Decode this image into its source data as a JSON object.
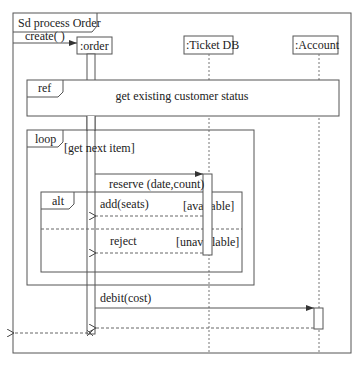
{
  "frame": {
    "kind": "Sd",
    "title": "Sd process Order"
  },
  "lifelines": [
    {
      "label": ":order"
    },
    {
      "label": ":Ticket DB"
    },
    {
      "label": ":Account"
    }
  ],
  "messages": {
    "create": "create(  )",
    "reserve": "reserve (date,count)",
    "add_seats": "add(seats)",
    "reject": "reject",
    "debit": "debit(cost)"
  },
  "fragments": {
    "ref": {
      "operator": "ref",
      "text": "get existing customer status"
    },
    "loop": {
      "operator": "loop",
      "guard": "[get next item]"
    },
    "alt": {
      "operator": "alt",
      "guards": [
        "[available]",
        "[unavailable]"
      ]
    }
  },
  "colors": {
    "line": "#555555",
    "text": "#222222",
    "background": "#ffffff"
  }
}
